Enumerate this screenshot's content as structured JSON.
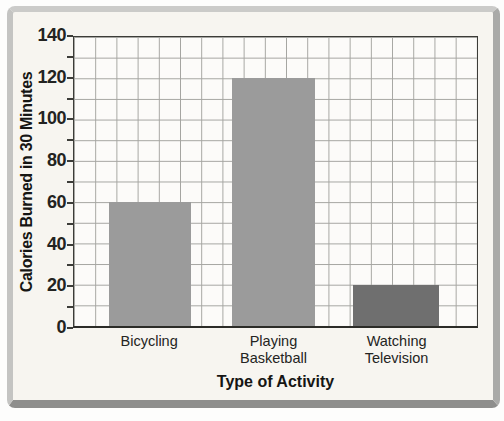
{
  "chart_data": {
    "type": "bar",
    "title": "",
    "categories": [
      "Bicycling",
      "Playing Basketball",
      "Watching Television"
    ],
    "values": [
      60,
      120,
      20
    ],
    "xlabel": "Type of Activity",
    "ylabel": "Calories Burned in 30 Minutes",
    "ylim": [
      0,
      140
    ],
    "yticks": [
      0,
      20,
      40,
      60,
      80,
      100,
      120,
      140
    ],
    "minor_grid_step": 10,
    "grid": "on, square cells of 10 units, both axes",
    "legend": "none",
    "bars": [
      {
        "label_lines": [
          "Bicycling"
        ],
        "value": 60,
        "color": "#9b9b9b",
        "center_frac": 0.188,
        "width_frac": 0.2025
      },
      {
        "label_lines": [
          "Playing",
          "Basketball"
        ],
        "value": 120,
        "color": "#9b9b9b",
        "center_frac": 0.495,
        "width_frac": 0.205
      },
      {
        "label_lines": [
          "Watching",
          "Television"
        ],
        "value": 20,
        "color": "#6f6f6f",
        "center_frac": 0.799,
        "width_frac": 0.215
      }
    ],
    "colors": {
      "bar_medium_gray": "#9b9b9b",
      "bar_dark_gray": "#6f6f6f",
      "grid_line": "#a5a5a1",
      "axis_line": "#3c3c38",
      "text": "#1f1f1d",
      "card_background": "#f7f5f0",
      "plot_background": "#fcfbf9",
      "frame_light": "#cbcbc9",
      "frame_dark": "#8e8e8c"
    }
  }
}
